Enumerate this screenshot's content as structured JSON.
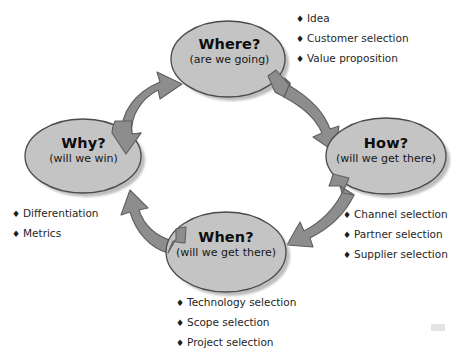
{
  "diagram": {
    "colors": {
      "node_fill": "#c4c4c4",
      "node_stroke": "#4a4a4a",
      "arrow_fill": "#8a8a8a",
      "arrow_stroke": "#5d5d5d",
      "shadow": "#b9b9b9",
      "text": "#111111",
      "background": "#ffffff"
    },
    "nodes": [
      {
        "id": "where",
        "title": "Where?",
        "subtitle": "(are we going)",
        "cx": 228,
        "cy": 59,
        "rx": 57,
        "ry": 38
      },
      {
        "id": "how",
        "title": "How?",
        "subtitle": "(will we get there)",
        "cx": 386,
        "cy": 156,
        "rx": 60,
        "ry": 38
      },
      {
        "id": "when",
        "title": "When?",
        "subtitle": "(will we get there)",
        "cx": 226,
        "cy": 252,
        "rx": 60,
        "ry": 40
      },
      {
        "id": "why",
        "title": "Why?",
        "subtitle": "(will we win)",
        "cx": 83,
        "cy": 156,
        "rx": 58,
        "ry": 37
      }
    ],
    "arrows": [
      {
        "id": "where-to-how",
        "from": "where",
        "to": "how",
        "heads": "single"
      },
      {
        "id": "how-to-when",
        "from": "how",
        "to": "when",
        "heads": "single"
      },
      {
        "id": "when-to-why",
        "from": "when",
        "to": "why",
        "heads": "single"
      },
      {
        "id": "why-to-where",
        "from": "why",
        "to": "where",
        "heads": "double"
      }
    ],
    "bullet_marker": "♦",
    "lists": [
      {
        "id": "where-list",
        "for_node": "where",
        "items": [
          "Idea",
          "Customer selection",
          "Value proposition"
        ]
      },
      {
        "id": "how-list",
        "for_node": "how",
        "items": [
          "Channel selection",
          "Partner selection",
          "Supplier selection"
        ]
      },
      {
        "id": "when-list",
        "for_node": "when",
        "items": [
          "Technology selection",
          "Scope selection",
          "Project selection"
        ]
      },
      {
        "id": "why-list",
        "for_node": "why",
        "items": [
          "Differentiation",
          "Metrics"
        ]
      }
    ]
  }
}
